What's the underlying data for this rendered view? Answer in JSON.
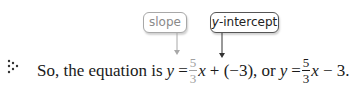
{
  "callouts": {
    "slope": {
      "label": "slope",
      "color": "#8a8a8a"
    },
    "intercept": {
      "label_italic": "y",
      "label_rest": "-intercept",
      "color": "#222222"
    }
  },
  "bullet": {
    "icon": "dotted-triangle-bullet-icon"
  },
  "sentence": {
    "lead": "So, the equation is",
    "var_y": "y",
    "equals": "=",
    "fraction1": {
      "numerator": "5",
      "denominator": "3",
      "color": "#a0a0a0"
    },
    "var_x": "x",
    "plus_part": "+ (−3), or",
    "var_y2": "y",
    "equals2": "=",
    "fraction2": {
      "numerator": "5",
      "denominator": "3"
    },
    "var_x2": "x",
    "tail": "− 3."
  }
}
